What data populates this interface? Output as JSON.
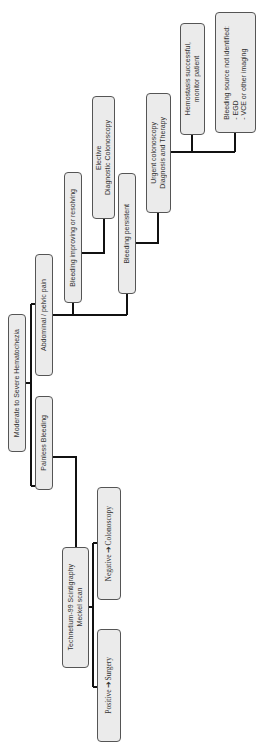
{
  "diagram": {
    "type": "flowchart",
    "orientation": "rotated-90-ccw",
    "root": {
      "label": "Moderate to Severe Hematochezia"
    },
    "branches": {
      "abdominal_pain": {
        "label": "Abdominal / pelvic pain",
        "improving": {
          "label": "Bleeding improving or resolving",
          "next": "Elective\nDiagnostic Colonoscopy"
        },
        "persistent": {
          "label": "Bleeding persistent",
          "next": "Urgent colonoscopy\nDiagnosis and Therapy",
          "outcomes": {
            "success": "Hemostasis successful,\nmonitor patient",
            "not_identified": "Bleeding source not identified:\n- EGD\n- VCE or other imaging"
          }
        }
      },
      "painless": {
        "label": "Painless Bleeding",
        "next": "Technetium-99 Scintigraphy\nMeckel scan",
        "outcomes": {
          "negative": "Negative ➔Colonoscopy",
          "positive": "Positive ➔Surgery"
        }
      }
    },
    "colors": {
      "box_fill": "#ebebeb",
      "box_border": "#555555",
      "connector": "#111111",
      "text": "#333333"
    }
  }
}
